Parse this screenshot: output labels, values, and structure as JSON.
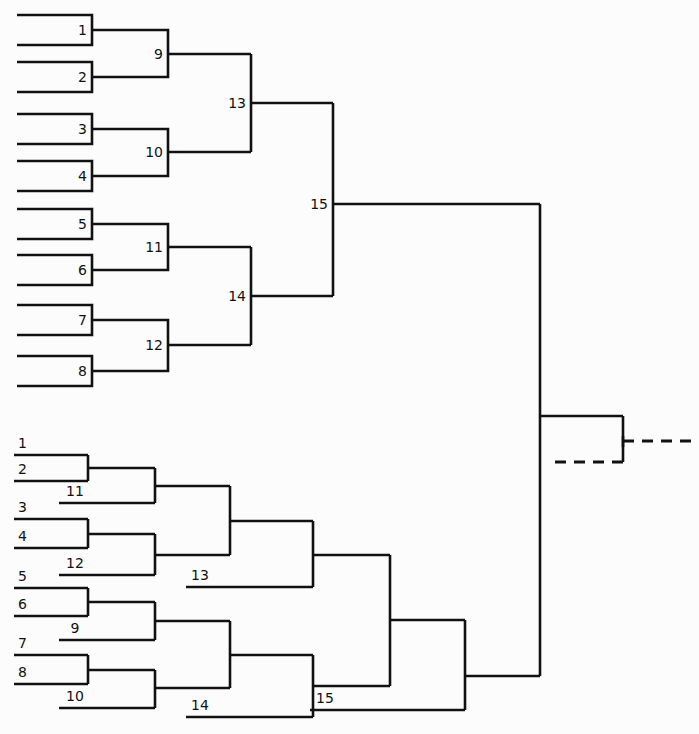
{
  "figure": {
    "title": "",
    "background_color": "#fcfcfc",
    "line_color": "#111111",
    "width": 699,
    "height": 734
  },
  "top_tree": {
    "name": "top-dendrogram",
    "leaves": [
      {
        "label": "1",
        "x": 92,
        "y": 30
      },
      {
        "label": "2",
        "x": 92,
        "y": 77
      },
      {
        "label": "3",
        "x": 92,
        "y": 129
      },
      {
        "label": "4",
        "x": 92,
        "y": 176
      },
      {
        "label": "5",
        "x": 92,
        "y": 224
      },
      {
        "label": "6",
        "x": 92,
        "y": 270
      },
      {
        "label": "7",
        "x": 92,
        "y": 320
      },
      {
        "label": "8",
        "x": 92,
        "y": 371
      }
    ],
    "internal_nodes": [
      {
        "label": "9",
        "x": 168,
        "y": 54
      },
      {
        "label": "10",
        "x": 168,
        "y": 152
      },
      {
        "label": "11",
        "x": 168,
        "y": 247
      },
      {
        "label": "12",
        "x": 168,
        "y": 345
      },
      {
        "label": "13",
        "x": 251,
        "y": 103
      },
      {
        "label": "14",
        "x": 251,
        "y": 296
      },
      {
        "label": "15",
        "x": 333,
        "y": 204
      }
    ],
    "root_stem": {
      "from_x": 333,
      "to_x": 540,
      "y": 204
    }
  },
  "bottom_tree": {
    "name": "bottom-dendrogram",
    "leaves": [
      {
        "label": "1",
        "x": 88,
        "y": 455
      },
      {
        "label": "2",
        "x": 88,
        "y": 481
      },
      {
        "label": "3",
        "x": 88,
        "y": 519
      },
      {
        "label": "4",
        "x": 88,
        "y": 548
      },
      {
        "label": "5",
        "x": 88,
        "y": 588
      },
      {
        "label": "6",
        "x": 88,
        "y": 616
      },
      {
        "label": "7",
        "x": 88,
        "y": 655
      },
      {
        "label": "8",
        "x": 88,
        "y": 684
      }
    ],
    "internal_nodes": [
      {
        "label": "11",
        "x": 155,
        "y": 503
      },
      {
        "label": "12",
        "x": 155,
        "y": 575
      },
      {
        "label": "9",
        "x": 155,
        "y": 640
      },
      {
        "label": "10",
        "x": 155,
        "y": 708
      },
      {
        "label": "13",
        "x": 230,
        "y": 587
      },
      {
        "label": "14",
        "x": 230,
        "y": 717
      },
      {
        "label": "15",
        "x": 313,
        "y": 710
      }
    ],
    "root_stem": {
      "from_x": 465,
      "to_x": 540,
      "y": 676
    }
  },
  "trunk": {
    "name": "shared-trunk",
    "x": 540,
    "top_y": 204,
    "bottom_y": 676,
    "branch_y": 416,
    "branch_to_x": 623
  },
  "dashed_continuation": {
    "name": "dashed-continuation",
    "upper_y": 462,
    "upper_from_x": 555,
    "upper_to_x": 623,
    "stub_y": 441,
    "stub_from_x": 623,
    "stub_to_x": 699,
    "vertical_x": 623,
    "vertical_from_y": 416,
    "vertical_to_y": 462
  },
  "legend": {
    "description": "Two hierarchical clustering dendrograms joined at a common trunk, with a dashed continuation on the right."
  }
}
